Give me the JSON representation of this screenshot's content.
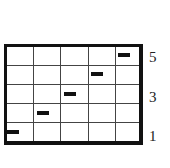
{
  "diagram": {
    "rows": 5,
    "columns": 5,
    "right_labels": [
      {
        "text": "5",
        "row": 5
      },
      {
        "text": "3",
        "row": 3
      },
      {
        "text": "1",
        "row": 1
      }
    ],
    "marks": [
      {
        "row": 1,
        "column": 1
      },
      {
        "row": 2,
        "column": 2
      },
      {
        "row": 3,
        "column": 3
      },
      {
        "row": 4,
        "column": 4
      },
      {
        "row": 5,
        "column": 5
      }
    ],
    "colors": {
      "line": "#444444",
      "border": "#111111",
      "mark": "#111111",
      "background": "#ffffff"
    }
  }
}
